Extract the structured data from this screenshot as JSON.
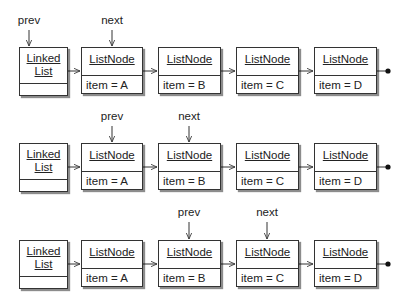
{
  "rows": [
    {
      "pointers": [
        {
          "label": "prev",
          "target": "list"
        },
        {
          "label": "next",
          "target": "A"
        }
      ],
      "list": {
        "title_line1": "Linked",
        "title_line2": "List"
      },
      "nodes": [
        {
          "title": "ListNode",
          "item": "item = A"
        },
        {
          "title": "ListNode",
          "item": "item = B"
        },
        {
          "title": "ListNode",
          "item": "item = C"
        },
        {
          "title": "ListNode",
          "item": "item = D"
        }
      ]
    },
    {
      "pointers": [
        {
          "label": "prev",
          "target": "A"
        },
        {
          "label": "next",
          "target": "B"
        }
      ],
      "list": {
        "title_line1": "Linked",
        "title_line2": "List"
      },
      "nodes": [
        {
          "title": "ListNode",
          "item": "item = A"
        },
        {
          "title": "ListNode",
          "item": "item = B"
        },
        {
          "title": "ListNode",
          "item": "item = C"
        },
        {
          "title": "ListNode",
          "item": "item = D"
        }
      ]
    },
    {
      "pointers": [
        {
          "label": "prev",
          "target": "B"
        },
        {
          "label": "next",
          "target": "C"
        }
      ],
      "list": {
        "title_line1": "Linked",
        "title_line2": "List"
      },
      "nodes": [
        {
          "title": "ListNode",
          "item": "item = A"
        },
        {
          "title": "ListNode",
          "item": "item = B"
        },
        {
          "title": "ListNode",
          "item": "item = C"
        },
        {
          "title": "ListNode",
          "item": "item = D"
        }
      ]
    }
  ],
  "colors": {
    "line": "#333333",
    "shadow": "#777777",
    "background": "#ffffff"
  }
}
